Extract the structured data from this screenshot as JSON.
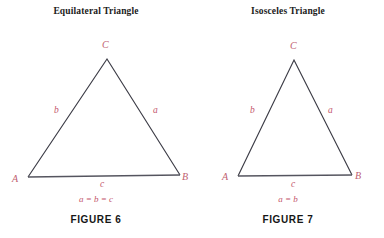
{
  "figures": [
    {
      "title": "Equilateral Triangle",
      "caption": "FIGURE  6",
      "relation": "a = b = c",
      "vertices": {
        "apex": "C",
        "left": "A",
        "right": "B"
      },
      "sides": {
        "left": "b",
        "right": "a",
        "base": "c"
      },
      "geometry": {
        "apex_x": 107,
        "apex_y": 59,
        "left_x": 28,
        "left_y": 177,
        "right_x": 180,
        "right_y": 175
      },
      "labels_pos": {
        "apex": {
          "x": 102,
          "y": 40
        },
        "left": {
          "x": 12,
          "y": 174
        },
        "right": {
          "x": 182,
          "y": 172
        },
        "side_left": {
          "x": 54,
          "y": 106
        },
        "side_right": {
          "x": 153,
          "y": 106
        },
        "side_base": {
          "x": 100,
          "y": 180
        }
      }
    },
    {
      "title": "Isosceles Triangle",
      "caption": "FIGURE  7",
      "relation": "a = b",
      "vertices": {
        "apex": "C",
        "left": "A",
        "right": "B"
      },
      "sides": {
        "left": "b",
        "right": "a",
        "base": "c"
      },
      "geometry": {
        "apex_x": 102,
        "apex_y": 60,
        "left_x": 46,
        "left_y": 176,
        "right_x": 160,
        "right_y": 175
      },
      "labels_pos": {
        "apex": {
          "x": 98,
          "y": 41
        },
        "left": {
          "x": 30,
          "y": 172
        },
        "right": {
          "x": 163,
          "y": 171
        },
        "side_left": {
          "x": 58,
          "y": 106
        },
        "side_right": {
          "x": 136,
          "y": 106
        },
        "side_base": {
          "x": 99,
          "y": 180
        }
      }
    }
  ],
  "colors": {
    "background": "#ffffff",
    "stroke": "#3c3c46",
    "annotation": "#c4566c",
    "title": "#1b1b1b"
  }
}
